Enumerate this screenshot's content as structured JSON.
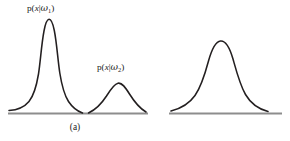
{
  "figure": {
    "background_color": "#ffffff",
    "stroke_color": "#231f20",
    "axis_color": "#8d8d8d",
    "panels": [
      {
        "id": "a",
        "caption": "(a)",
        "description": "Two non-overlapping class-conditional densities with different means and variances",
        "curves": [
          {
            "label_prefix": "p(",
            "label_var": "x",
            "label_bar": "|",
            "label_omega": "ω",
            "label_sub": "1",
            "label_suffix": ")",
            "label_text": "p(x|ω1)",
            "peak_x": 47,
            "peak_y": 20,
            "baseline_y": 113,
            "left_tail_x": 10,
            "right_tail_x": 79,
            "amplitude": 93,
            "width": 14
          },
          {
            "label_prefix": "p(",
            "label_var": "x",
            "label_bar": "|",
            "label_omega": "ω",
            "label_sub": "2",
            "label_suffix": ")",
            "label_text": "p(x|ω2)",
            "peak_x": 118,
            "peak_y": 82,
            "baseline_y": 113,
            "left_tail_x": 88,
            "right_tail_x": 148,
            "amplitude": 31,
            "width": 17
          }
        ],
        "axis": {
          "x_start": 8,
          "x_end": 148,
          "y": 113
        }
      },
      {
        "id": "b",
        "caption": "(b)",
        "description": "Identical overlapping class-conditional densities",
        "curves": [
          {
            "label_prefix": "p(",
            "label_var": "x",
            "label_bar": "|",
            "label_omega": "ω",
            "label_sub": "1",
            "label_equals": "=",
            "label_sub2": "2",
            "label_suffix": ")",
            "label_text": "p(x|ω1) = p(x|ω2)",
            "peak_x": 75,
            "peak_y": 41,
            "baseline_y": 113,
            "left_tail_x": 20,
            "right_tail_x": 124,
            "amplitude": 72,
            "width": 17
          }
        ],
        "axis": {
          "x_start": 19,
          "x_end": 132,
          "y": 113
        }
      }
    ]
  }
}
